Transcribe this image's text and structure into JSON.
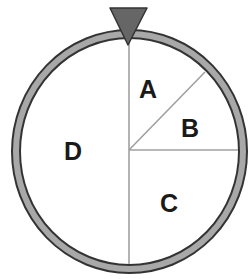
{
  "diagram": {
    "type": "spinner",
    "sections": [
      {
        "id": "A",
        "label": "A"
      },
      {
        "id": "B",
        "label": "B"
      },
      {
        "id": "C",
        "label": "C"
      },
      {
        "id": "D",
        "label": "D"
      }
    ],
    "pointer": "triangle-pointer",
    "colors": {
      "ring_fill": "#a8a8a8",
      "ring_stroke": "#333333",
      "divider": "#a0a0a0",
      "pointer_fill": "#666666",
      "label": "#1a1a1a"
    }
  }
}
